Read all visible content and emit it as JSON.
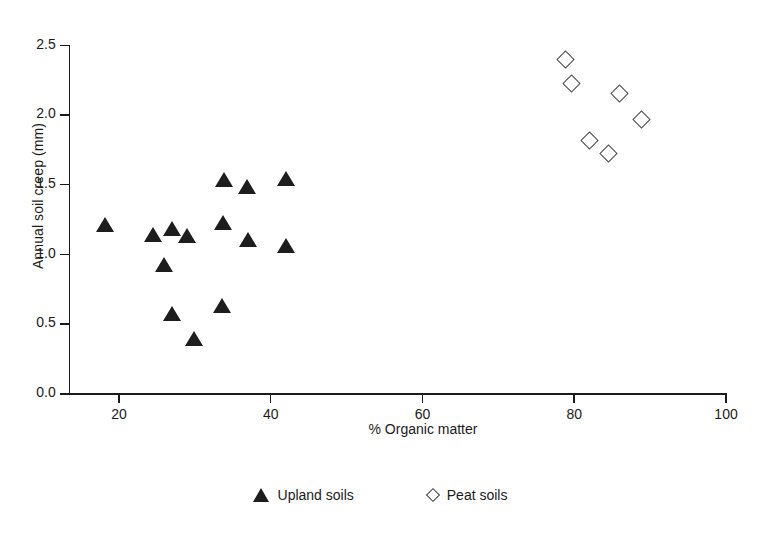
{
  "chart_data": {
    "type": "scatter",
    "title": "",
    "xlabel": "% Organic matter",
    "ylabel": "Annual soil creep (mm)",
    "xlim": [
      13.5,
      100
    ],
    "ylim": [
      0.0,
      2.5
    ],
    "xticks": [
      20,
      40,
      60,
      80,
      100
    ],
    "xtick_labels": [
      "20",
      "40",
      "60",
      "80",
      "100"
    ],
    "yticks": [
      0.0,
      0.5,
      1.0,
      1.5,
      2.0,
      2.5
    ],
    "ytick_labels": [
      "0.0",
      "0.5",
      "1.0",
      "1.5",
      "2.0",
      "2.5"
    ],
    "grid": false,
    "legend_position": "below-center",
    "series": [
      {
        "name": "Upland soils",
        "marker": "filled-triangle",
        "color": "#1d1d1d",
        "points": [
          {
            "x": 18.3,
            "y": 1.21
          },
          {
            "x": 24.6,
            "y": 1.14
          },
          {
            "x": 26.1,
            "y": 0.92
          },
          {
            "x": 27.1,
            "y": 1.18
          },
          {
            "x": 27.1,
            "y": 0.57
          },
          {
            "x": 29.1,
            "y": 1.13
          },
          {
            "x": 30.0,
            "y": 0.39
          },
          {
            "x": 33.7,
            "y": 0.63
          },
          {
            "x": 33.9,
            "y": 1.22
          },
          {
            "x": 34.0,
            "y": 1.53
          },
          {
            "x": 37.0,
            "y": 1.48
          },
          {
            "x": 37.1,
            "y": 1.1
          },
          {
            "x": 42.1,
            "y": 1.06
          },
          {
            "x": 42.1,
            "y": 1.54
          }
        ]
      },
      {
        "name": "Peat soils",
        "marker": "open-diamond",
        "color": "#4a4a4a",
        "points": [
          {
            "x": 79.0,
            "y": 2.39
          },
          {
            "x": 79.8,
            "y": 2.22
          },
          {
            "x": 82.1,
            "y": 1.81
          },
          {
            "x": 84.6,
            "y": 1.72
          },
          {
            "x": 86.1,
            "y": 2.15
          },
          {
            "x": 89.0,
            "y": 1.96
          }
        ]
      }
    ]
  },
  "legend": {
    "items": [
      {
        "label": "Upland soils",
        "marker": "filled-triangle"
      },
      {
        "label": "Peat soils",
        "marker": "open-diamond"
      }
    ]
  }
}
